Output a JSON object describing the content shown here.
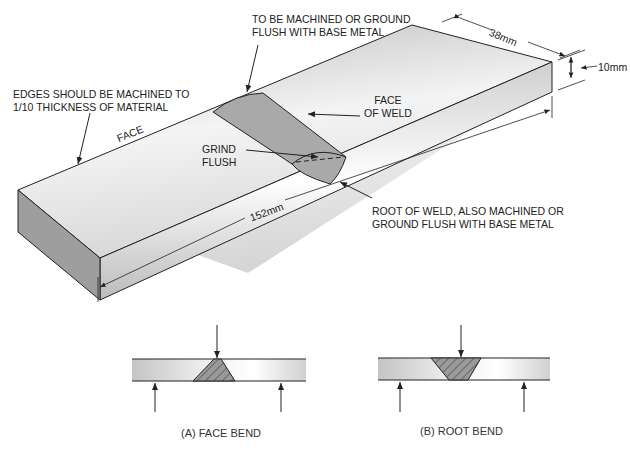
{
  "diagram": {
    "type": "weld bend test specimen",
    "specimen": {
      "labels": {
        "top_note_line1": "TO BE MACHINED OR GROUND",
        "top_note_line2": "FLUSH WITH BASE METAL",
        "edges_note_line1": "EDGES SHOULD BE MACHINED TO",
        "edges_note_line2": "1/10 THICKNESS OF MATERIAL",
        "face": "FACE",
        "face_of_weld_line1": "FACE",
        "face_of_weld_line2": "OF WELD",
        "grind_flush_line1": "GRIND",
        "grind_flush_line2": "FLUSH",
        "root_note_line1": "ROOT OF WELD, ALSO MACHINED OR",
        "root_note_line2": "GROUND FLUSH WITH BASE METAL"
      },
      "dimensions": {
        "width": "38mm",
        "thickness": "10mm",
        "length": "152mm"
      }
    },
    "bend_tests": [
      {
        "caption": "(A) FACE BEND"
      },
      {
        "caption": "(B) ROOT BEND"
      }
    ],
    "colors": {
      "weld_fill": "#a9a9a9",
      "line": "#222222",
      "plate_shade": "#c8c8c8"
    }
  }
}
